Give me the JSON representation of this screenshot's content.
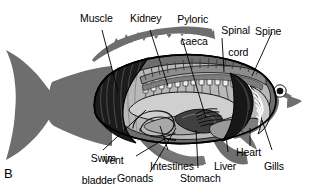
{
  "figure": {
    "panel_letter": "B",
    "colors": {
      "body_gray": "#6e6e6e",
      "body_gray_dark": "#5e5e5e",
      "muscle_dark": "#1a1a1a",
      "cavity_light": "#b9b9b9",
      "organ_mid": "#8d8d8d",
      "organ_light": "#d2d2d2",
      "outline": "#000000",
      "background": "#ffffff",
      "text": "#000000"
    }
  },
  "labels": {
    "muscle": "Muscle",
    "kidney": "Kidney",
    "pyloric_caeca_line1": "Pyloric",
    "pyloric_caeca_line2": "caeca",
    "spinal_cord_line1": "Spinal",
    "spinal_cord_line2": "cord",
    "spine": "Spine",
    "swim_bladder_line1": "Swim",
    "swim_bladder_line2": "bladder",
    "vent": "Vent",
    "gonads": "Gonads",
    "intestines": "Intestines",
    "stomach": "Stomach",
    "liver": "Liver",
    "heart": "Heart",
    "gills": "Gills"
  }
}
